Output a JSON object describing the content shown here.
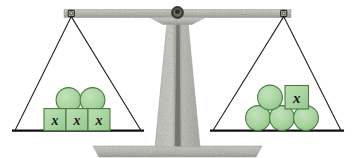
{
  "diagram": {
    "type": "balance-scale",
    "state": "balanced",
    "colors": {
      "shape_fill": "#a9d4a0",
      "shape_stroke": "#4a7a44",
      "metal_light": "#c9c9c4",
      "metal_mid": "#b0b0ab",
      "metal_dark": "#7d7d79",
      "string": "#1f1f1f",
      "pan_bar": "#111111",
      "text": "#1c1c1c",
      "background": "#ffffff"
    },
    "variable_label": "x",
    "left_pan": {
      "name": "left-pan",
      "squares": [
        {
          "label": "x"
        },
        {
          "label": "x"
        },
        {
          "label": "x"
        }
      ],
      "circles_count": 2,
      "square_count": 3,
      "total_items": 5
    },
    "right_pan": {
      "name": "right-pan",
      "squares": [
        {
          "label": "x"
        }
      ],
      "circles_count": 4,
      "square_count": 1,
      "total_items": 5
    },
    "parts": {
      "beam": "beam",
      "pivot": "pivot",
      "column": "center-column",
      "base": "base-slab",
      "left_strings": "left-pan-strings",
      "right_strings": "right-pan-strings"
    }
  }
}
